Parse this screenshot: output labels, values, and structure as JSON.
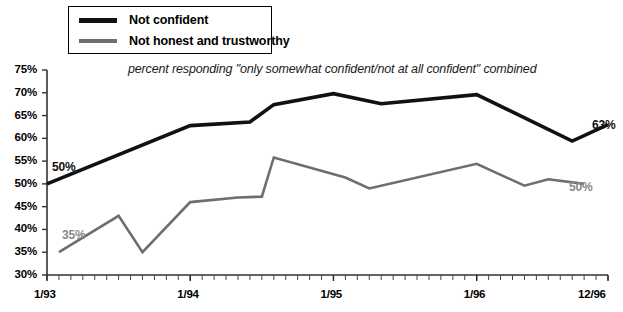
{
  "legend": {
    "items": [
      {
        "label": "Not confident",
        "color": "#111111",
        "weight": "thick"
      },
      {
        "label": "Not honest and trustworthy",
        "color": "#6e6e6e",
        "weight": "normal"
      }
    ]
  },
  "subtitle": "percent responding \"only somewhat confident/not at all confident\" combined",
  "annotations": [
    {
      "name": "start-label-not-confident",
      "text": "50%",
      "color": "#111111",
      "x": 52,
      "y": 160
    },
    {
      "name": "start-label-not-honest",
      "text": "35%",
      "color": "#8a8a8a",
      "x": 62,
      "y": 228
    },
    {
      "name": "end-label-not-confident",
      "text": "63%",
      "color": "#111111",
      "x": 592,
      "y": 118
    },
    {
      "name": "end-label-not-honest",
      "text": "50%",
      "color": "#8a8a8a",
      "x": 569,
      "y": 180
    }
  ],
  "chart_data": {
    "type": "line",
    "title": "",
    "subtitle": "percent responding \"only somewhat confident/not at all confident\" combined",
    "xlabel": "",
    "ylabel": "",
    "ylim": [
      30,
      75
    ],
    "ytick_labels": [
      "30%",
      "35%",
      "40%",
      "45%",
      "50%",
      "55%",
      "60%",
      "65%",
      "70%",
      "75%"
    ],
    "ytick_values": [
      30,
      35,
      40,
      45,
      50,
      55,
      60,
      65,
      70,
      75
    ],
    "xtick_labels": [
      "1/93",
      "1/94",
      "1/95",
      "1/96",
      "12/96"
    ],
    "xtick_values": [
      0,
      12,
      24,
      36,
      47
    ],
    "x_minor_tick_count": 48,
    "xlim": [
      0,
      47
    ],
    "grid": false,
    "legend_position": "top-left",
    "series": [
      {
        "name": "Not confident",
        "color": "#111111",
        "stroke_width": 3.6,
        "points": [
          {
            "x": 0,
            "y": 50.0
          },
          {
            "x": 12,
            "y": 62.8
          },
          {
            "x": 17,
            "y": 63.6
          },
          {
            "x": 19,
            "y": 67.4
          },
          {
            "x": 24,
            "y": 69.8
          },
          {
            "x": 28,
            "y": 67.6
          },
          {
            "x": 36,
            "y": 69.6
          },
          {
            "x": 44,
            "y": 59.4
          },
          {
            "x": 47,
            "y": 63.0
          }
        ]
      },
      {
        "name": "Not honest and trustworthy",
        "color": "#6e6e6e",
        "stroke_width": 2.6,
        "points": [
          {
            "x": 1,
            "y": 35.0
          },
          {
            "x": 6,
            "y": 43.0
          },
          {
            "x": 8,
            "y": 35.0
          },
          {
            "x": 12,
            "y": 46.0
          },
          {
            "x": 16,
            "y": 47.0
          },
          {
            "x": 18,
            "y": 47.2
          },
          {
            "x": 19,
            "y": 55.8
          },
          {
            "x": 25,
            "y": 51.4
          },
          {
            "x": 27,
            "y": 49.0
          },
          {
            "x": 36,
            "y": 54.4
          },
          {
            "x": 40,
            "y": 49.6
          },
          {
            "x": 42,
            "y": 51.0
          },
          {
            "x": 45,
            "y": 50.0
          }
        ]
      }
    ]
  }
}
